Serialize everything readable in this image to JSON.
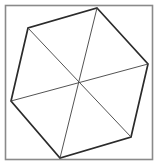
{
  "figure": {
    "title": "Hexagon partitioned into six triangles",
    "canvas": {
      "width": 160,
      "height": 167,
      "background": "#ffffff"
    },
    "frame": {
      "label": "square-border",
      "x": 5.5,
      "y": 5.5,
      "width": 147,
      "height": 154,
      "stroke_color": "#8a8a8a",
      "stroke_width": 1.6,
      "fill": "#ffffff"
    },
    "shape": {
      "name": "hexagon",
      "sides": 6,
      "stroke_color": "#2b2b2b",
      "stroke_width": 1.7,
      "fill": "none",
      "vertices": [
        {
          "label": "top",
          "x": 97,
          "y": 8
        },
        {
          "label": "right",
          "x": 148,
          "y": 64
        },
        {
          "label": "bottom-right",
          "x": 131,
          "y": 137
        },
        {
          "label": "bottom",
          "x": 60,
          "y": 158
        },
        {
          "label": "left",
          "x": 11,
          "y": 101
        },
        {
          "label": "top-left",
          "x": 28,
          "y": 28
        }
      ],
      "points_attr": "97,8 148,64 131,137 60,158 11,101 28,28"
    },
    "center": {
      "label": "centroid",
      "x": 79,
      "y": 83
    },
    "diagonals": [
      {
        "label": "diagonal-top-to-bottom",
        "from": "top",
        "to": "bottom",
        "x1": 97,
        "y1": 8,
        "x2": 60,
        "y2": 158
      },
      {
        "label": "diagonal-right-to-left",
        "from": "right",
        "to": "left",
        "x1": 148,
        "y1": 64,
        "x2": 11,
        "y2": 101
      },
      {
        "label": "diagonal-bottomright-to-topleft",
        "from": "bottom-right",
        "to": "top-left",
        "x1": 131,
        "y1": 137,
        "x2": 28,
        "y2": 28
      }
    ],
    "region_count": 6,
    "diagonal_stroke_color": "#4a4a4a",
    "diagonal_stroke_width": 0.95
  }
}
